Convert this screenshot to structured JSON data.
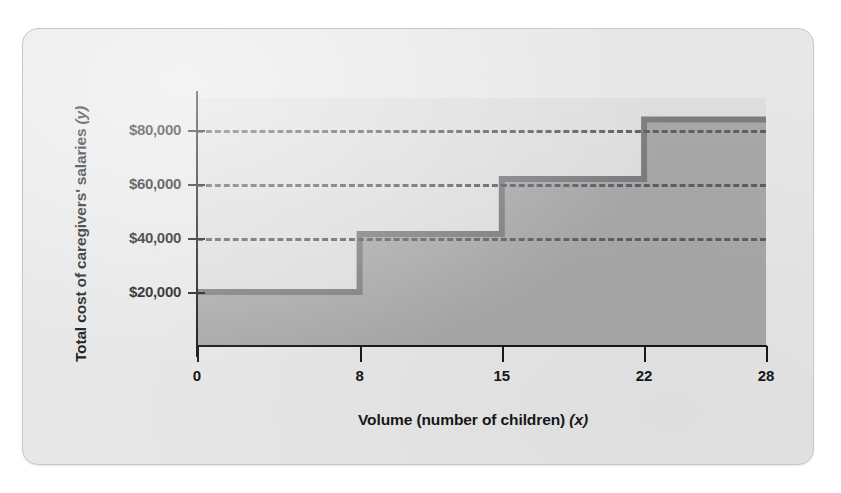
{
  "figure": {
    "background_color": "#e7e7e7",
    "plot_background_color": "#dedede",
    "step_fill_color": "#a8a8a8",
    "step_line_color": "#7b7d80",
    "gridline_color": "#5d6063",
    "axis_color": "#16181a"
  },
  "chart_data": {
    "type": "line",
    "subtype": "step",
    "title": "",
    "xlabel": "Volume (number of children) (x)",
    "xlabel_text": "Volume (number of children)",
    "xlabel_variable": "(x)",
    "ylabel": "Total cost of caregivers' salaries (y)",
    "ylabel_text": "Total cost of caregivers' salaries",
    "ylabel_variable": "(y)",
    "xlim": [
      0,
      28
    ],
    "ylim": [
      0,
      92000
    ],
    "xticks": [
      0,
      8,
      15,
      22,
      28
    ],
    "xtick_labels": [
      "0",
      "8",
      "15",
      "22",
      "28"
    ],
    "yticks": [
      20000,
      40000,
      60000,
      80000
    ],
    "ytick_labels": [
      "$20,000",
      "$40,000",
      "$60,000",
      "$80,000"
    ],
    "grid": "horizontal-dashed-at-yticks-40000-60000-80000",
    "gridline_values": [
      40000,
      60000,
      80000
    ],
    "legend": "none",
    "steps": [
      {
        "x_start": 0,
        "x_end": 8,
        "y": 20000
      },
      {
        "x_start": 8,
        "x_end": 15,
        "y": 41500
      },
      {
        "x_start": 15,
        "x_end": 22,
        "y": 62000
      },
      {
        "x_start": 22,
        "x_end": 28,
        "y": 84000
      }
    ],
    "x": [
      0,
      8,
      8,
      15,
      15,
      22,
      22,
      28
    ],
    "y": [
      20000,
      20000,
      41500,
      41500,
      62000,
      62000,
      84000,
      84000
    ],
    "annotations": []
  }
}
